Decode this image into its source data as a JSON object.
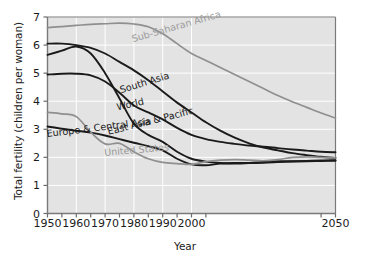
{
  "chart_data": {
    "type": "line",
    "title": "",
    "xlabel": "Year",
    "ylabel": "Total fertility (children per woman)",
    "xlim": [
      1950,
      2050
    ],
    "ylim": [
      0,
      7
    ],
    "xticks": [
      1950,
      1960,
      1970,
      1980,
      1990,
      2000,
      2050
    ],
    "xtick_minor": [
      1955,
      1965,
      1975,
      1985,
      1995,
      2005,
      2045
    ],
    "yticks": [
      0,
      1,
      2,
      3,
      4,
      5,
      6,
      7
    ],
    "grid": true,
    "grid_color": "#ffffff",
    "plot_bg": "#e3e3e3",
    "legend": "inline-labels",
    "series": [
      {
        "name": "Sub-Saharan Africa",
        "color": "#8f8f8f",
        "label_x": 1995,
        "label_y": 6.55,
        "label_rotation": -16,
        "x": [
          1950,
          1955,
          1960,
          1965,
          1970,
          1975,
          1980,
          1985,
          1990,
          1995,
          2000,
          2005,
          2010,
          2015,
          2020,
          2025,
          2030,
          2035,
          2040,
          2045,
          2050
        ],
        "values": [
          6.62,
          6.66,
          6.7,
          6.74,
          6.76,
          6.78,
          6.75,
          6.65,
          6.4,
          6.05,
          5.7,
          5.45,
          5.2,
          4.95,
          4.7,
          4.45,
          4.2,
          3.98,
          3.78,
          3.58,
          3.4
        ]
      },
      {
        "name": "South Asia",
        "color": "#1a1a1a",
        "label_x": 1984,
        "label_y": 4.55,
        "label_rotation": -17,
        "x": [
          1950,
          1955,
          1960,
          1965,
          1970,
          1975,
          1980,
          1985,
          1990,
          1995,
          2000,
          2005,
          2010,
          2015,
          2020,
          2025,
          2030,
          2035,
          2040,
          2045,
          2050
        ],
        "values": [
          6.05,
          6.05,
          6.0,
          5.9,
          5.7,
          5.4,
          5.1,
          4.75,
          4.35,
          3.95,
          3.6,
          3.25,
          2.95,
          2.7,
          2.5,
          2.35,
          2.25,
          2.15,
          2.08,
          2.02,
          1.98
        ]
      },
      {
        "name": "World",
        "color": "#1a1a1a",
        "label_x": 1979,
        "label_y": 3.78,
        "label_rotation": -13,
        "x": [
          1950,
          1955,
          1960,
          1965,
          1970,
          1975,
          1980,
          1985,
          1990,
          1995,
          2000,
          2005,
          2010,
          2015,
          2020,
          2025,
          2030,
          2035,
          2040,
          2045,
          2050
        ],
        "values": [
          4.95,
          4.98,
          4.98,
          4.92,
          4.7,
          4.3,
          3.85,
          3.6,
          3.35,
          3.05,
          2.8,
          2.65,
          2.55,
          2.48,
          2.42,
          2.38,
          2.33,
          2.28,
          2.24,
          2.2,
          2.18
        ]
      },
      {
        "name": "East Asia & Pacific",
        "color": "#1a1a1a",
        "label_x": 1986,
        "label_y": 3.18,
        "label_rotation": -14,
        "x": [
          1950,
          1955,
          1960,
          1965,
          1970,
          1975,
          1980,
          1985,
          1990,
          1995,
          2000,
          2005,
          2010,
          2015,
          2020,
          2025,
          2030,
          2035,
          2040,
          2045,
          2050
        ],
        "values": [
          5.65,
          5.8,
          5.95,
          5.7,
          5.0,
          4.1,
          3.2,
          2.8,
          2.55,
          2.2,
          1.95,
          1.85,
          1.8,
          1.78,
          1.8,
          1.84,
          1.86,
          1.86,
          1.86,
          1.87,
          1.88
        ]
      },
      {
        "name": "Europe & Central Asia",
        "color": "#1a1a1a",
        "label_x": 1968,
        "label_y": 2.95,
        "label_rotation": -7,
        "x": [
          1950,
          1955,
          1960,
          1965,
          1970,
          1975,
          1980,
          1985,
          1990,
          1995,
          2000,
          2005,
          2010,
          2015,
          2020,
          2025,
          2030,
          2035,
          2040,
          2045,
          2050
        ],
        "values": [
          3.1,
          3.02,
          2.95,
          2.88,
          2.78,
          2.65,
          2.52,
          2.4,
          2.25,
          1.95,
          1.75,
          1.72,
          1.78,
          1.8,
          1.8,
          1.81,
          1.83,
          1.85,
          1.87,
          1.89,
          1.9
        ]
      },
      {
        "name": "United States",
        "color": "#8f8f8f",
        "label_x": 1981,
        "label_y": 2.15,
        "label_rotation": -5,
        "x": [
          1950,
          1955,
          1960,
          1965,
          1970,
          1975,
          1980,
          1985,
          1990,
          1995,
          2000,
          2005,
          2010,
          2015,
          2020,
          2025,
          2030,
          2035,
          2040,
          2045,
          2050
        ],
        "values": [
          3.6,
          3.55,
          3.45,
          2.9,
          2.48,
          2.5,
          2.2,
          1.95,
          1.82,
          1.78,
          1.75,
          1.85,
          1.9,
          1.92,
          1.9,
          1.88,
          1.92,
          2.0,
          2.02,
          2.0,
          1.98
        ]
      }
    ]
  }
}
